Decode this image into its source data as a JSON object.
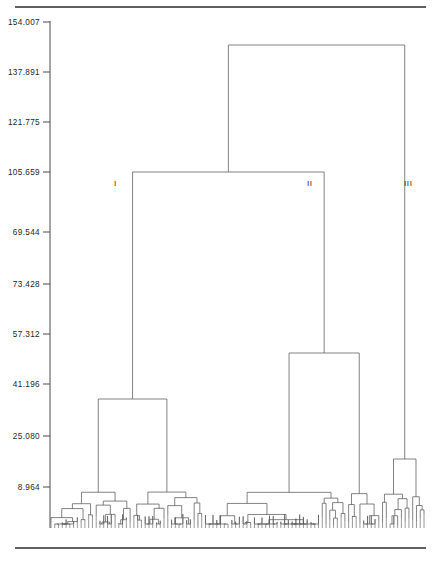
{
  "figure": {
    "type": "dendrogram",
    "title": "",
    "width": 435,
    "height": 563,
    "background": "#ffffff",
    "line_color": "#5a5a5a",
    "rule_color": "#2b2b2b",
    "text_color": "#1f1f1f"
  },
  "axis": {
    "orientation": "vertical-left",
    "label": "",
    "tick_labels": [
      "154.007",
      "137.891",
      "121.775",
      "105.659",
      "69.544",
      "73.428",
      "57.312",
      "41.196",
      "25.080",
      "8.964"
    ],
    "tick_values": [
      154.007,
      137.891,
      121.775,
      105.659,
      89.544,
      73.428,
      57.312,
      41.196,
      25.08,
      8.964
    ],
    "tick_y_px": [
      22,
      72,
      122,
      172,
      232,
      284,
      334,
      384,
      436,
      487
    ],
    "axis_x_px": 50,
    "axis_top_px": 22,
    "axis_bottom_px": 528
  },
  "cluster_labels": [
    {
      "text": "I",
      "x": 114,
      "y": 185
    },
    {
      "text": "II",
      "x": 307,
      "y": 185
    },
    {
      "text": "III",
      "x": 404,
      "y": 185
    }
  ],
  "rules": [
    {
      "name": "top-rule",
      "x1": 15,
      "x2": 426,
      "y": 7
    },
    {
      "name": "bottom-rule",
      "x1": 15,
      "x2": 426,
      "y": 548
    }
  ],
  "chart_data": {
    "type": "dendrogram",
    "title": "",
    "xlabel": "",
    "ylabel": "",
    "ylim": [
      0,
      154.007
    ],
    "grid": false,
    "legend": "none",
    "n_leaves": 100,
    "leaf_x_start": 51,
    "leaf_x_end": 424,
    "leaf_baseline_y": 528,
    "axis_ticks": [
      154.007,
      137.891,
      121.775,
      105.659,
      89.544,
      73.428,
      57.312,
      41.196,
      25.08,
      8.964
    ],
    "axis_tick_labels": [
      "154.007",
      "137.891",
      "121.775",
      "105.659",
      "69.544",
      "73.428",
      "57.312",
      "41.196",
      "25.080",
      "8.964"
    ],
    "cluster_groups": [
      "I",
      "II",
      "III"
    ],
    "merges": [
      {
        "id": "root",
        "x1": 206,
        "x2": 402,
        "y": 45,
        "label": ""
      },
      {
        "id": "n-I-II",
        "x1": 106,
        "x2": 304,
        "y": 172,
        "label": ""
      },
      {
        "id": "n-I",
        "x1": 77,
        "x2": 137,
        "y": 399,
        "label": "I"
      },
      {
        "id": "n-II",
        "x1": 261,
        "x2": 341,
        "y": 353,
        "label": "II"
      },
      {
        "id": "n-III",
        "x1": 388,
        "x2": 417,
        "y": 459,
        "label": "III"
      }
    ]
  }
}
